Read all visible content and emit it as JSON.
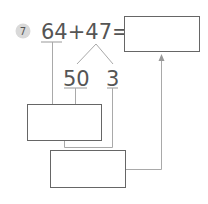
{
  "problem": {
    "number": "7",
    "expression": "64+47=",
    "operand_a": "64",
    "plus": "+",
    "operand_b": "47",
    "equals": "=",
    "split_left": "50",
    "split_right": "3",
    "answer_box": "",
    "step1_box": "",
    "step2_box": ""
  },
  "colors": {
    "line": "#a9a9a9",
    "box_border": "#666666",
    "badge": "#d9d9d9",
    "text": "#555555"
  }
}
